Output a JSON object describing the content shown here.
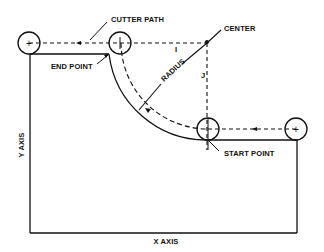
{
  "diagram": {
    "labels": {
      "cutter_path": "CUTTER PATH",
      "center": "CENTER",
      "end_point": "END POINT",
      "radius": "RADIUS",
      "i": "I",
      "j": "J",
      "start_point": "START POINT",
      "y_axis": "Y AXIS",
      "x_axis": "X AXIS"
    },
    "tool_positions": [
      {
        "name": "left-tool",
        "marker": "+"
      },
      {
        "name": "end-tool",
        "marker": "+"
      },
      {
        "name": "start-tool",
        "marker": "+"
      },
      {
        "name": "right-tool",
        "marker": "+"
      }
    ],
    "colors": {
      "line": "#111111",
      "background": "#ffffff"
    }
  }
}
